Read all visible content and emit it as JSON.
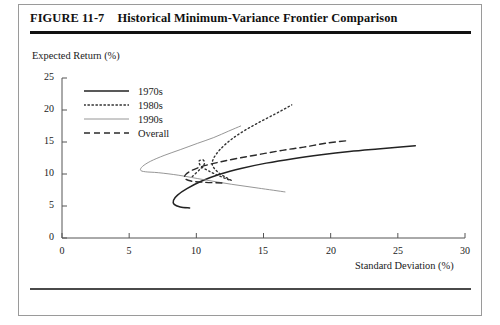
{
  "figure": {
    "number": "FIGURE 11-7",
    "title": "Historical Minimum-Variance Frontier Comparison"
  },
  "chart_data": {
    "type": "line",
    "title": "Historical Minimum-Variance Frontier Comparison",
    "xlabel": "Standard Deviation (%)",
    "ylabel": "Expected Return (%)",
    "xlim": [
      0,
      30
    ],
    "ylim": [
      0,
      25
    ],
    "xticks": [
      0,
      5,
      10,
      15,
      20,
      25,
      30
    ],
    "yticks": [
      0,
      5,
      10,
      15,
      20,
      25
    ],
    "grid": false,
    "legend_position": "upper-left-inside",
    "series": [
      {
        "name": "1970s",
        "style": "solid",
        "color": "#222222",
        "width": 1.5,
        "points": [
          [
            9.5,
            4.7
          ],
          [
            8.8,
            4.85
          ],
          [
            8.35,
            5.25
          ],
          [
            8.3,
            5.9
          ],
          [
            8.6,
            6.7
          ],
          [
            9.3,
            7.7
          ],
          [
            10.4,
            8.9
          ],
          [
            11.8,
            10.0
          ],
          [
            13.4,
            10.9
          ],
          [
            15.2,
            11.7
          ],
          [
            17.2,
            12.4
          ],
          [
            19.3,
            13.0
          ],
          [
            21.4,
            13.5
          ],
          [
            23.5,
            13.9
          ],
          [
            25.2,
            14.2
          ],
          [
            26.3,
            14.4
          ]
        ]
      },
      {
        "name": "1980s",
        "style": "dotted",
        "color": "#333333",
        "width": 1.4,
        "points": [
          [
            9.7,
            9.6
          ],
          [
            10.3,
            10.8
          ],
          [
            10.6,
            11.6
          ],
          [
            10.5,
            12.2
          ],
          [
            10.2,
            12.0
          ],
          [
            10.35,
            11.2
          ],
          [
            10.9,
            10.5
          ],
          [
            11.6,
            9.8
          ],
          [
            12.3,
            9.2
          ],
          [
            12.6,
            9.0
          ],
          [
            12.3,
            9.35
          ],
          [
            11.6,
            10.3
          ],
          [
            11.2,
            11.4
          ],
          [
            11.3,
            12.5
          ],
          [
            11.8,
            13.9
          ],
          [
            12.6,
            15.4
          ],
          [
            13.6,
            16.8
          ],
          [
            14.7,
            18.1
          ],
          [
            15.8,
            19.3
          ],
          [
            16.6,
            20.2
          ],
          [
            17.1,
            20.8
          ]
        ]
      },
      {
        "name": "1990s",
        "style": "solid-thin",
        "color": "#8a8a8a",
        "width": 0.9,
        "points": [
          [
            16.6,
            7.2
          ],
          [
            14.6,
            7.8
          ],
          [
            12.6,
            8.4
          ],
          [
            10.6,
            9.1
          ],
          [
            8.7,
            9.8
          ],
          [
            7.2,
            10.2
          ],
          [
            6.2,
            10.35
          ],
          [
            5.85,
            10.6
          ],
          [
            6.0,
            11.2
          ],
          [
            6.6,
            12.0
          ],
          [
            7.6,
            12.9
          ],
          [
            8.8,
            13.8
          ],
          [
            10.1,
            14.8
          ],
          [
            11.3,
            15.7
          ],
          [
            12.4,
            16.7
          ],
          [
            13.3,
            17.5
          ]
        ]
      },
      {
        "name": "Overall",
        "style": "dashed",
        "color": "#2b2b2b",
        "width": 1.4,
        "points": [
          [
            11.9,
            8.6
          ],
          [
            10.6,
            8.7
          ],
          [
            9.6,
            8.9
          ],
          [
            9.15,
            9.3
          ],
          [
            9.2,
            9.9
          ],
          [
            9.7,
            10.6
          ],
          [
            10.6,
            11.3
          ],
          [
            11.8,
            11.9
          ],
          [
            13.2,
            12.5
          ],
          [
            14.8,
            13.1
          ],
          [
            16.4,
            13.7
          ],
          [
            18.0,
            14.2
          ],
          [
            19.6,
            14.8
          ],
          [
            21.2,
            15.2
          ]
        ]
      }
    ]
  },
  "axis": {
    "y_title": "Expected Return (%)",
    "x_title": "Standard Deviation (%)",
    "y_tick_labels": [
      "25",
      "20",
      "15",
      "10",
      "5",
      "0"
    ],
    "x_tick_labels": [
      "0",
      "5",
      "10",
      "15",
      "20",
      "25",
      "30"
    ]
  },
  "legend": {
    "items": [
      {
        "label": "1970s",
        "style": "solid"
      },
      {
        "label": "1980s",
        "style": "dotted"
      },
      {
        "label": "1990s",
        "style": "solid-thin"
      },
      {
        "label": "Overall",
        "style": "dashed"
      }
    ]
  }
}
